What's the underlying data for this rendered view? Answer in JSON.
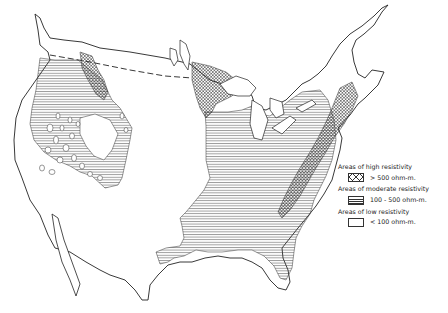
{
  "map": {
    "title": "Earth resistivity map of the conterminous United States",
    "colors": {
      "ink": "#333333",
      "background": "#ffffff"
    }
  },
  "legend": {
    "items": [
      {
        "heading": "Areas of high resistivity",
        "pattern": "crosshatch",
        "value": "> 500 ohm-m."
      },
      {
        "heading": "Areas of moderate resistivity",
        "pattern": "horizontal-lines",
        "value": "100 - 500 ohm-m."
      },
      {
        "heading": "Areas of low resistivity",
        "pattern": "blank",
        "value": "< 100 ohm-m."
      }
    ]
  }
}
